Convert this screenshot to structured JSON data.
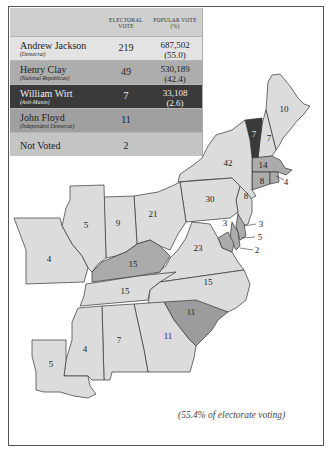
{
  "colors": {
    "jackson": "#dcdcdc",
    "clay": "#ababab",
    "wirt": "#3a3a3a",
    "floyd": "#9c9c9c",
    "not_voted": "#c6c6c6",
    "legend_bg": "#c9c9c9"
  },
  "legend": {
    "headers": {
      "electoral_vote_line1": "ELECTORAL",
      "electoral_vote_line2": "VOTE",
      "popular_vote_line1": "POPULAR VOTE",
      "popular_vote_line2": "(%)"
    },
    "rows": [
      {
        "name": "Andrew Jackson",
        "party": "(Democrat)",
        "electoral": "219",
        "popular": "687,502",
        "percent": "(55.0)",
        "bg": "#e3e3e3",
        "fg": "#222"
      },
      {
        "name": "Henry Clay",
        "party": "(National Republican)",
        "electoral": "49",
        "popular": "530,189",
        "percent": "(42.4)",
        "bg": "#adadad",
        "fg": "#222"
      },
      {
        "name": "William Wirt",
        "party": "(Anti-Mason)",
        "electoral": "7",
        "popular": "33,108",
        "percent": "(2.6)",
        "bg": "#3a3a3a",
        "fg": "#eeeeee"
      },
      {
        "name": "John Floyd",
        "party": "(Independent Democrat)",
        "electoral": "11",
        "popular": "",
        "percent": "",
        "bg": "#a0a0a0",
        "fg": "#222"
      },
      {
        "name": "Not Voted",
        "party": "",
        "electoral": "2",
        "popular": "",
        "percent": "",
        "bg": "#c4c4c4",
        "fg": "#222"
      }
    ]
  },
  "map": {
    "states": [
      {
        "abbr": "ME",
        "votes": "10",
        "winner": "jackson"
      },
      {
        "abbr": "NH",
        "votes": "7",
        "winner": "jackson"
      },
      {
        "abbr": "VT",
        "votes": "7",
        "winner": "wirt"
      },
      {
        "abbr": "MA",
        "votes": "14",
        "winner": "clay"
      },
      {
        "abbr": "RI",
        "votes": "4",
        "winner": "clay"
      },
      {
        "abbr": "CT",
        "votes": "8",
        "winner": "clay"
      },
      {
        "abbr": "NY",
        "votes": "42",
        "winner": "jackson"
      },
      {
        "abbr": "NJ",
        "votes": "8",
        "winner": "jackson"
      },
      {
        "abbr": "PA",
        "votes": "30",
        "winner": "jackson"
      },
      {
        "abbr": "DE",
        "votes": "3",
        "winner": "clay"
      },
      {
        "abbr": "MD-clay",
        "votes": "5",
        "winner": "clay"
      },
      {
        "abbr": "MD-jackson",
        "votes": "3",
        "winner": "jackson"
      },
      {
        "abbr": "MD-notvoted",
        "votes": "2",
        "winner": "not_voted"
      },
      {
        "abbr": "OH",
        "votes": "21",
        "winner": "jackson"
      },
      {
        "abbr": "IN",
        "votes": "9",
        "winner": "jackson"
      },
      {
        "abbr": "IL",
        "votes": "5",
        "winner": "jackson"
      },
      {
        "abbr": "MO",
        "votes": "4",
        "winner": "jackson"
      },
      {
        "abbr": "KY",
        "votes": "15",
        "winner": "clay"
      },
      {
        "abbr": "VA",
        "votes": "23",
        "winner": "jackson"
      },
      {
        "abbr": "TN",
        "votes": "15",
        "winner": "jackson"
      },
      {
        "abbr": "NC",
        "votes": "15",
        "winner": "jackson"
      },
      {
        "abbr": "SC",
        "votes": "11",
        "winner": "floyd"
      },
      {
        "abbr": "GA",
        "votes": "11",
        "winner": "jackson"
      },
      {
        "abbr": "AL",
        "votes": "7",
        "winner": "jackson"
      },
      {
        "abbr": "MS",
        "votes": "4",
        "winner": "jackson"
      },
      {
        "abbr": "LA",
        "votes": "5",
        "winner": "jackson"
      }
    ]
  },
  "caption": "(55.4% of electorate voting)"
}
